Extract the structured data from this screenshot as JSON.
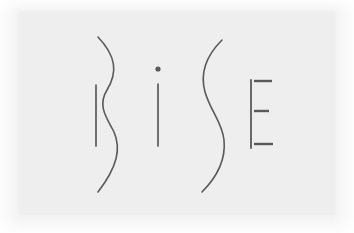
{
  "artwork": {
    "title": "BiSE",
    "kind": "logo-mark",
    "wordmark_text": "BiSE",
    "letters": [
      "B",
      "i",
      "S",
      "E"
    ],
    "style": "minimal thin hand-drawn calligraphic line strokes",
    "background_color": "#f2f2f2",
    "panel_color": "#eeeeee",
    "stroke_color": "#5a5a5c",
    "stroke_width": "1.6",
    "canvas": {
      "width": 354,
      "height": 233
    }
  },
  "glyphs": {
    "b": {
      "name": "B",
      "stem": {
        "x": 96,
        "y_top": 85,
        "y_bottom": 146
      },
      "curve_path": "M 98 37 C 116 56 118 72 107 90 C 97 106 107 118 114 132 C 121 148 118 166 98 192"
    },
    "i": {
      "name": "i",
      "dot": {
        "cx": 158,
        "cy": 69,
        "r": 2.6
      },
      "stem": {
        "x": 158,
        "y_top": 84,
        "y_bottom": 146
      }
    },
    "s": {
      "name": "S",
      "curve_path": "M 222 40 C 206 56 200 74 205 92 C 211 112 222 122 224 140 C 226 160 218 176 202 192"
    },
    "e": {
      "name": "E",
      "stem": {
        "x": 251,
        "y_top": 80,
        "y_bottom": 148
      },
      "bars": [
        {
          "position": "top",
          "x1": 254,
          "x2": 272,
          "y": 81
        },
        {
          "position": "middle",
          "x1": 254,
          "x2": 269,
          "y": 111
        },
        {
          "position": "bottom",
          "x1": 254,
          "x2": 273,
          "y": 144
        }
      ]
    }
  }
}
